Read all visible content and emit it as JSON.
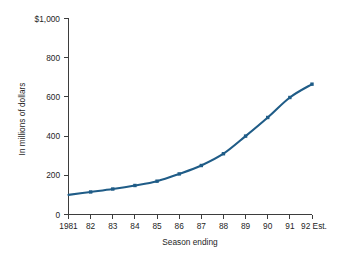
{
  "chart_data": {
    "type": "line",
    "title": "",
    "xlabel": "Season ending",
    "ylabel": "In millions of dollars",
    "categories": [
      "1981",
      "82",
      "83",
      "84",
      "85",
      "86",
      "87",
      "88",
      "89",
      "90",
      "91",
      "92 Est."
    ],
    "values": [
      100,
      115,
      130,
      148,
      170,
      207,
      250,
      310,
      400,
      495,
      597,
      665
    ],
    "series": [
      {
        "name": "Revenue",
        "values": [
          100,
          115,
          130,
          148,
          170,
          207,
          250,
          310,
          400,
          495,
          597,
          665
        ]
      }
    ],
    "ylim": [
      0,
      1000
    ],
    "yticks": [
      0,
      200,
      400,
      600,
      800,
      1000
    ],
    "ytick_labels": [
      "0",
      "200",
      "400",
      "600",
      "800",
      "$1,000"
    ],
    "grid": false,
    "legend": false,
    "legend_position": "none",
    "series_color": "#1f5c87",
    "axis_color": "#3d3d3d",
    "background_color": "#ffffff",
    "marker": "square"
  }
}
